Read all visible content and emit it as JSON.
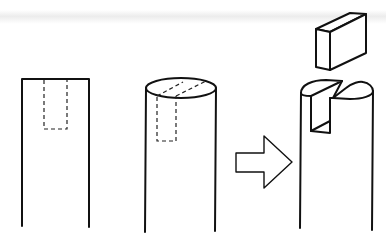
{
  "diagram": {
    "type": "process-illustration",
    "colors": {
      "line": "#111111",
      "background": "#ffffff",
      "scan_band": "#e4e4e4"
    },
    "steps": [
      {
        "id": "step-1",
        "label": "",
        "view": "side view of post with dashed outline of slot"
      },
      {
        "id": "step-2",
        "label": "",
        "view": "perspective post with dashed slot outline through top ellipse"
      },
      {
        "id": "arrow",
        "label": "",
        "view": "hollow right-pointing arrow"
      },
      {
        "id": "step-3",
        "label": "",
        "view": "post with slot cut out and rectangular block lifted above"
      }
    ]
  }
}
